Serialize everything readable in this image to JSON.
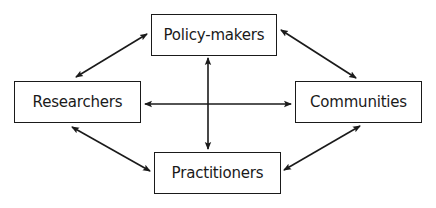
{
  "diagram": {
    "type": "stakeholder-relationship",
    "nodes": [
      {
        "id": "policy",
        "label": "Policy-makers",
        "x": 151,
        "y": 14,
        "w": 126,
        "h": 42
      },
      {
        "id": "researchers",
        "label": "Researchers",
        "x": 14,
        "y": 81,
        "w": 127,
        "h": 42
      },
      {
        "id": "communities",
        "label": "Communities",
        "x": 295,
        "y": 81,
        "w": 127,
        "h": 42
      },
      {
        "id": "practitioners",
        "label": "Practitioners",
        "x": 154,
        "y": 152,
        "w": 127,
        "h": 42
      }
    ],
    "edges": [
      {
        "from": "researchers",
        "to": "policy",
        "bidirectional": true,
        "x1": 76,
        "y1": 77,
        "x2": 147,
        "y2": 34
      },
      {
        "from": "policy",
        "to": "communities",
        "bidirectional": true,
        "x1": 281,
        "y1": 30,
        "x2": 356,
        "y2": 78
      },
      {
        "from": "researchers",
        "to": "practitioners",
        "bidirectional": true,
        "x1": 72,
        "y1": 127,
        "x2": 150,
        "y2": 171
      },
      {
        "from": "communities",
        "to": "practitioners",
        "bidirectional": true,
        "x1": 360,
        "y1": 126,
        "x2": 284,
        "y2": 170
      },
      {
        "from": "researchers",
        "to": "communities",
        "bidirectional": true,
        "x1": 145,
        "y1": 104,
        "x2": 291,
        "y2": 104
      },
      {
        "from": "policy",
        "to": "practitioners",
        "bidirectional": true,
        "x1": 208,
        "y1": 58,
        "x2": 208,
        "y2": 149
      }
    ],
    "colors": {
      "stroke": "#1a1a1a",
      "background": "#ffffff",
      "text": "#1a1a1a"
    }
  }
}
